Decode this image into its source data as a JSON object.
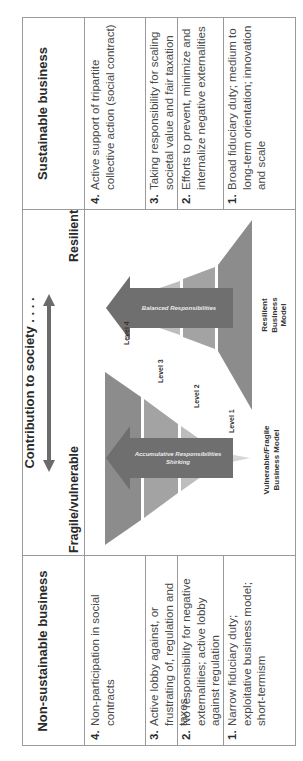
{
  "header": {
    "left_title": "Non-sustainable business",
    "middle_title": "Contribution to society . . . .",
    "right_title": "Sustainable business",
    "left_pole": "Fragile/vulnerable",
    "right_pole": "Resilient"
  },
  "non_sustainable": [
    {
      "num": "4.",
      "text": "Non-participation in social contracts"
    },
    {
      "num": "3.",
      "text": "Active lobby against, or frustrating of, regulation and taxes"
    },
    {
      "num": "2.",
      "text": "No responsibility for negative externalities; active lobby against regulation"
    },
    {
      "num": "1.",
      "text": "Narrow fiduciary duty; exploitative business model; short-termism"
    }
  ],
  "sustainable": [
    {
      "num": "4.",
      "text": "Active support of tripartite collective action (social contract)"
    },
    {
      "num": "3.",
      "text": "Taking responsibility for scaling societal value and fair taxation"
    },
    {
      "num": "2.",
      "text": "Efforts to prevent, minimize and internalize negative externalities"
    },
    {
      "num": "1.",
      "text": "Broad fiduciary duty; medium to long-term orientation; innovation and scale"
    }
  ],
  "diagram": {
    "levels": [
      "Level 4",
      "Level 3",
      "Level 2",
      "Level 1"
    ],
    "fragile_arrow_label": "Accumulative Responsibilities Shirking",
    "resilient_arrow_label": "Balanced Responsibilities",
    "fragile_model_label": "Vulnerable/Fragile Business Model",
    "resilient_model_label": "Resilient Business Model",
    "colors": {
      "band_darkest": "#8c8c8c",
      "band_dark": "#a3a3a3",
      "band_light": "#bdbdbd",
      "band_lightest": "#d6d6d6",
      "arrow": "#6f6f6f",
      "double_arrow": "#6b6b6b",
      "border": "#9a9a9a"
    }
  }
}
